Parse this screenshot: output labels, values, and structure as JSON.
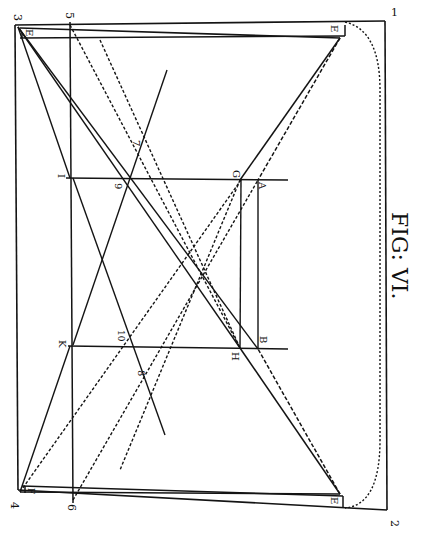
{
  "figure": {
    "title": "FIG: VI.",
    "ink_color": "#141414",
    "paper_color": "#ffffff"
  },
  "labels": {
    "n1": "1",
    "n2": "2",
    "n3": "3",
    "n4": "4",
    "n5": "5",
    "n6": "6",
    "n7": "7",
    "n8": "8",
    "n9": "9",
    "n10": "10",
    "E_top_left": "E",
    "E_top_right": "E",
    "E_bottom_right": "E",
    "F": "F",
    "I": "I",
    "K": "K",
    "G": "G",
    "A": "A",
    "H": "H",
    "B": "B"
  }
}
